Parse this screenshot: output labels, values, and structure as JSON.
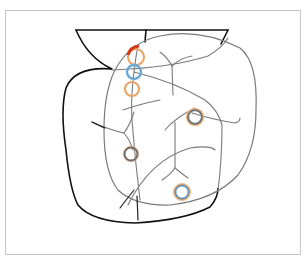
{
  "figure": {
    "caption": "",
    "colors": {
      "frame": "#c4c4c4",
      "outline_black": "#111111",
      "outline_gray": "#777777",
      "branch_gray": "#6a6a6a",
      "ring_orange": "#e9a56a",
      "ring_blue": "#6aa8d6",
      "ring_gray": "#6f6f6f",
      "marker_red": "#d23a1c"
    },
    "markers": [
      {
        "id": "m1",
        "cx": 136,
        "cy": 57,
        "r": 8,
        "color": "orange",
        "accent": "red-arc"
      },
      {
        "id": "m2",
        "cx": 134,
        "cy": 72,
        "r": 7,
        "color": "blue"
      },
      {
        "id": "m3",
        "cx": 132,
        "cy": 89,
        "r": 7,
        "color": "orange"
      },
      {
        "id": "m4",
        "cx": 195,
        "cy": 117,
        "r": 7,
        "color": "gray-orange"
      },
      {
        "id": "m5",
        "cx": 131,
        "cy": 154,
        "r": 7,
        "color": "gray-orange"
      },
      {
        "id": "m6",
        "cx": 182,
        "cy": 192,
        "r": 7,
        "color": "blue-orange"
      }
    ]
  }
}
